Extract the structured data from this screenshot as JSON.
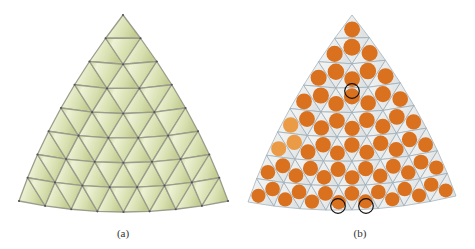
{
  "figure": {
    "panels": [
      {
        "id": "a",
        "caption": "(a)",
        "description": "Curved triangular surface patch with regular triangular mesh (8 subdivisions per edge)",
        "colors": {
          "fill": "#d6dfae",
          "fill_light": "#eef2d6",
          "edge": "#9a9c8c",
          "vertex": "#555555"
        },
        "subdivisions": 8,
        "geometry": {
          "apex": [
            123,
            15
          ],
          "bottom_left": [
            19,
            201
          ],
          "bottom_right": [
            228,
            201
          ],
          "bottom_mid_sag": 11,
          "side_bulge": 10
        }
      },
      {
        "id": "b",
        "caption": "(b)",
        "description": "Same mesh with circular packing: one orange disk inscribed in each triangle; three disks highlighted",
        "colors": {
          "fill": "#eceeee",
          "edge": "#9aa9b3",
          "disk": "#d9711e",
          "disk_light": "#eb9a45",
          "highlight_ring": "#111111"
        },
        "subdivisions": 8,
        "geometry": {
          "apex": [
            117,
            15
          ],
          "bottom_left": [
            13,
            202
          ],
          "bottom_right": [
            221,
            196
          ],
          "bottom_mid_sag": 11,
          "side_bulge": 10
        },
        "highlighted_disks": [
          [
            117,
            91
          ],
          [
            103,
            206
          ],
          [
            131,
            206
          ]
        ]
      }
    ]
  }
}
